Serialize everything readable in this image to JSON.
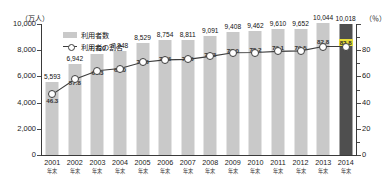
{
  "chart_data": {
    "type": "bar",
    "title": "",
    "categories": [
      "2001",
      "2002",
      "2003",
      "2004",
      "2005",
      "2006",
      "2007",
      "2008",
      "2009",
      "2010",
      "2011",
      "2012",
      "2013",
      "2014"
    ],
    "category_sublabel": "年末",
    "series": [
      {
        "name": "利用者数",
        "type": "bar",
        "axis": "left",
        "unit": "万人",
        "values": [
          5593,
          6942,
          7730,
          7948,
          8529,
          8754,
          8811,
          9091,
          9408,
          9462,
          9610,
          9652,
          10044,
          10018
        ],
        "value_labels": [
          "5,593",
          "6,942",
          "7,730",
          "7,948",
          "8,529",
          "8,754",
          "8,811",
          "9,091",
          "9,408",
          "9,462",
          "9,610",
          "9,652",
          "10,044",
          "10,018"
        ]
      },
      {
        "name": "利用者の割合",
        "type": "line",
        "axis": "right",
        "unit": "%",
        "values": [
          46.3,
          57.8,
          64.3,
          66.0,
          70.8,
          72.6,
          73.0,
          75.3,
          78.0,
          78.2,
          79.1,
          79.5,
          82.8,
          82.8
        ],
        "value_labels": [
          "46.3",
          "57.8",
          "64.3",
          "66.0",
          "70.8",
          "72.6",
          "73.0",
          "75.3",
          "78.0",
          "78.2",
          "79.1",
          "79.5",
          "82.8",
          "82.8"
        ]
      }
    ],
    "highlight_index": 13,
    "ylabel_left": "（万人）",
    "ylabel_right": "（％）",
    "ylim_left": [
      0,
      10000
    ],
    "ylim_right": [
      0,
      100
    ],
    "yticks_left": [
      "0",
      "2,000",
      "4,000",
      "6,000",
      "8,000",
      "10,000"
    ],
    "yticks_right": [
      "0",
      "20",
      "40",
      "60",
      "80"
    ],
    "grid": false,
    "legend_position": "top-left",
    "legend": [
      "利用者数",
      "利用者の割合"
    ]
  },
  "colors": {
    "bar": "#c9c9c9",
    "bar_highlight": "#4f4f4f",
    "line": "#3d3d3d",
    "highlight_label_bg": "#e8dd3a",
    "axis": "#3a3a3a",
    "text": "#1a1a1a",
    "background": "#ffffff"
  }
}
